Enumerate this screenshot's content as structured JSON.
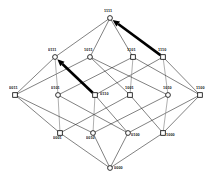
{
  "figure": {
    "background_color": "#ffffff",
    "line_color": "#1a1a1a",
    "vertical_line_color": "#8c8c8c",
    "highlight_color": "#000000"
  },
  "chart_data": {
    "type": "diagram",
    "title": "",
    "xlabel": "",
    "ylabel": "",
    "grid": false,
    "legend": "none",
    "nodes": [
      {
        "id": "1111",
        "label": "1111",
        "rank": 4,
        "x": 110,
        "y": 18,
        "shape": "circle",
        "label_dx": -6,
        "label_dy": -8
      },
      {
        "id": "0111",
        "label": "0111",
        "rank": 3,
        "x": 55,
        "y": 57,
        "shape": "circle",
        "label_dx": -7,
        "label_dy": -8
      },
      {
        "id": "1011",
        "label": "1011",
        "rank": 3,
        "x": 90,
        "y": 57,
        "shape": "circle",
        "label_dx": -6,
        "label_dy": -8
      },
      {
        "id": "1101",
        "label": "1101",
        "rank": 3,
        "x": 133,
        "y": 57,
        "shape": "square",
        "label_dx": -6,
        "label_dy": -8
      },
      {
        "id": "1110",
        "label": "1110",
        "rank": 3,
        "x": 163,
        "y": 57,
        "shape": "square",
        "label_dx": -5,
        "label_dy": -8
      },
      {
        "id": "0011",
        "label": "0011",
        "rank": 2,
        "x": 15,
        "y": 95,
        "shape": "square",
        "label_dx": -6,
        "label_dy": -8
      },
      {
        "id": "0101",
        "label": "0101",
        "rank": 2,
        "x": 58,
        "y": 95,
        "shape": "circle",
        "label_dx": -7,
        "label_dy": -8
      },
      {
        "id": "0110",
        "label": "0110",
        "rank": 2,
        "x": 95,
        "y": 95,
        "shape": "square",
        "label_dx": 5,
        "label_dy": -2
      },
      {
        "id": "1001",
        "label": "1001",
        "rank": 2,
        "x": 130,
        "y": 95,
        "shape": "square",
        "label_dx": -5,
        "label_dy": -8
      },
      {
        "id": "1010",
        "label": "1010",
        "rank": 2,
        "x": 168,
        "y": 95,
        "shape": "circle",
        "label_dx": -5,
        "label_dy": -8
      },
      {
        "id": "1100",
        "label": "1100",
        "rank": 2,
        "x": 200,
        "y": 95,
        "shape": "square",
        "label_dx": -4,
        "label_dy": -8
      },
      {
        "id": "0001",
        "label": "0001",
        "rank": 1,
        "x": 60,
        "y": 133,
        "shape": "square",
        "label_dx": -7,
        "label_dy": 4
      },
      {
        "id": "0010",
        "label": "0010",
        "rank": 1,
        "x": 93,
        "y": 133,
        "shape": "circle",
        "label_dx": -7,
        "label_dy": 4
      },
      {
        "id": "0100",
        "label": "0100",
        "rank": 1,
        "x": 128,
        "y": 133,
        "shape": "circle",
        "label_dx": 3,
        "label_dy": 1
      },
      {
        "id": "1000",
        "label": "1000",
        "rank": 1,
        "x": 163,
        "y": 133,
        "shape": "square",
        "label_dx": 3,
        "label_dy": 1
      },
      {
        "id": "0000",
        "label": "0000",
        "rank": 0,
        "x": 110,
        "y": 168,
        "shape": "circle",
        "label_dx": 4,
        "label_dy": -1
      }
    ],
    "edges": [
      {
        "from": "0000",
        "to": "0001",
        "style": "thin"
      },
      {
        "from": "0000",
        "to": "0010",
        "style": "thin"
      },
      {
        "from": "0000",
        "to": "0100",
        "style": "thin"
      },
      {
        "from": "0000",
        "to": "1000",
        "style": "thin"
      },
      {
        "from": "0001",
        "to": "0011",
        "style": "thin"
      },
      {
        "from": "0001",
        "to": "0101",
        "style": "vertical"
      },
      {
        "from": "0001",
        "to": "1001",
        "style": "thin"
      },
      {
        "from": "0010",
        "to": "0011",
        "style": "thin"
      },
      {
        "from": "0010",
        "to": "0110",
        "style": "vertical"
      },
      {
        "from": "0010",
        "to": "1010",
        "style": "thin"
      },
      {
        "from": "0100",
        "to": "0101",
        "style": "thin"
      },
      {
        "from": "0100",
        "to": "0110",
        "style": "thin"
      },
      {
        "from": "0100",
        "to": "1100",
        "style": "thin"
      },
      {
        "from": "1000",
        "to": "1001",
        "style": "thin"
      },
      {
        "from": "1000",
        "to": "1010",
        "style": "vertical"
      },
      {
        "from": "1000",
        "to": "1100",
        "style": "thin"
      },
      {
        "from": "0011",
        "to": "0111",
        "style": "thin"
      },
      {
        "from": "0011",
        "to": "1011",
        "style": "thin"
      },
      {
        "from": "0101",
        "to": "0111",
        "style": "vertical"
      },
      {
        "from": "0101",
        "to": "1101",
        "style": "thin"
      },
      {
        "from": "0110",
        "to": "0111",
        "style": "bold"
      },
      {
        "from": "0110",
        "to": "1110",
        "style": "thin"
      },
      {
        "from": "1001",
        "to": "1011",
        "style": "thin"
      },
      {
        "from": "1001",
        "to": "1101",
        "style": "vertical"
      },
      {
        "from": "1010",
        "to": "1011",
        "style": "thin"
      },
      {
        "from": "1010",
        "to": "1110",
        "style": "vertical"
      },
      {
        "from": "1100",
        "to": "1101",
        "style": "thin"
      },
      {
        "from": "1100",
        "to": "1110",
        "style": "thin"
      },
      {
        "from": "0111",
        "to": "1111",
        "style": "thin"
      },
      {
        "from": "1011",
        "to": "1111",
        "style": "thin"
      },
      {
        "from": "1101",
        "to": "1111",
        "style": "thin"
      },
      {
        "from": "1110",
        "to": "1111",
        "style": "bold"
      }
    ],
    "highlighted_edges": [
      {
        "from": "0110",
        "to": "0111",
        "arrow": true
      },
      {
        "from": "1110",
        "to": "1111",
        "arrow": true
      }
    ]
  }
}
